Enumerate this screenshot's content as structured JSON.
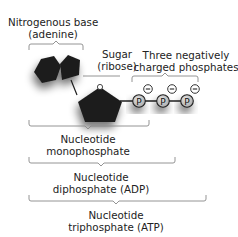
{
  "labels": {
    "base": {
      "line1": "Nitrogenous base",
      "line2": "(adenine)"
    },
    "sugar": {
      "line1": "Sugar",
      "line2": "(ribose)"
    },
    "phosphates": {
      "line1": "Three negatively",
      "line2": "charged phosphates"
    },
    "nmp": {
      "line1": "Nucleotide",
      "line2": "monophosphate"
    },
    "adp": {
      "line1": "Nucleotide",
      "line2": "diphosphate (ADP)"
    },
    "atp": {
      "line1": "Nucleotide",
      "line2": "triphosphate (ATP)"
    }
  },
  "phosphate_symbol": "P",
  "charge_symbol": "−",
  "colors": {
    "molecule_fill": "#1e1e1e",
    "phosphate_fill": "#c8c8c8",
    "bracket": "#888888",
    "text": "#222222"
  }
}
